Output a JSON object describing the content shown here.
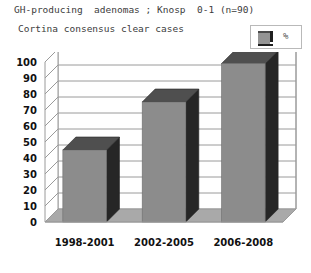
{
  "header": {
    "title": "GH-producing  adenomas ; Knosp  0-1 (n=90)",
    "subtitle": "Cortina consensus clear cases"
  },
  "legend": {
    "label": "%",
    "swatch_face_color": "#949494",
    "swatch_side_color": "#1f1f1f"
  },
  "chart_data": {
    "type": "bar",
    "title": "GH-producing  adenomas ; Knosp  0-1 (n=90)",
    "subtitle": "Cortina consensus clear cases",
    "categories": [
      "1998-2001",
      "2002-2005",
      "2006-2008"
    ],
    "series": [
      {
        "name": "%",
        "values": [
          45,
          75,
          99
        ]
      }
    ],
    "values": [
      45,
      75,
      99
    ],
    "xlabel": "",
    "ylabel": "",
    "ylim": [
      0,
      100
    ],
    "ytick_labels": [
      "100",
      "90",
      "80",
      "70",
      "60",
      "50",
      "40",
      "30",
      "20",
      "10",
      "0"
    ],
    "ytick_values": [
      100,
      90,
      80,
      70,
      60,
      50,
      40,
      30,
      20,
      10,
      0
    ],
    "grid": true,
    "legend_position": "top-right",
    "style": "3d-column",
    "bar_face_color": "#8c8c8c",
    "bar_side_color": "#262626",
    "bar_top_color": "#4f4f4f",
    "plot_border_color": "#9a9a9a",
    "gridline_color": "#9a9a9a",
    "floor_color": "#a9a9a9",
    "background_color": "#ffffff"
  }
}
